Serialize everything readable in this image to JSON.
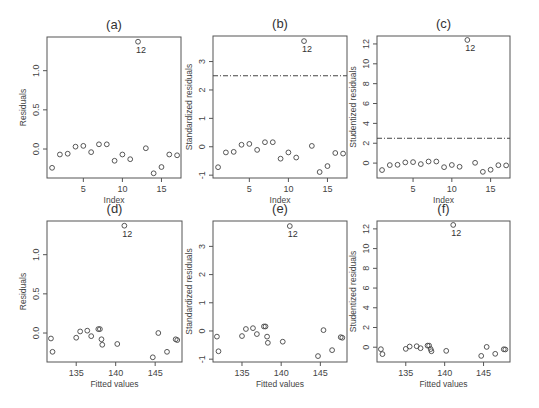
{
  "chart_data": [
    {
      "id": "a",
      "type": "scatter",
      "title": "(a)",
      "xlabel": "Index",
      "ylabel": "Residuals",
      "box": [
        47,
        37,
        181,
        178
      ],
      "xlim": [
        0.35,
        17.5
      ],
      "ylim": [
        -0.37,
        1.43
      ],
      "xticks": [
        5,
        10,
        15
      ],
      "yticks": [
        0.0,
        0.5,
        1.0
      ],
      "ytick_labels": [
        "0.0",
        "0.5",
        "1.0"
      ],
      "x": [
        1,
        2,
        3,
        4,
        5,
        6,
        7,
        8,
        9,
        10,
        11,
        12,
        13,
        14,
        15,
        16,
        17
      ],
      "y": [
        -0.24,
        -0.07,
        -0.06,
        0.03,
        0.04,
        -0.04,
        0.06,
        0.06,
        -0.15,
        -0.07,
        -0.13,
        1.37,
        0.01,
        -0.31,
        -0.23,
        -0.07,
        -0.08
      ],
      "annotations": [
        {
          "label": "12",
          "x": 12,
          "y": 1.37
        }
      ],
      "ref_line": null
    },
    {
      "id": "b",
      "type": "scatter",
      "title": "(b)",
      "xlabel": "Index",
      "ylabel": "Standardized residuals",
      "box": [
        213,
        36,
        347,
        178
      ],
      "xlim": [
        0.35,
        17.5
      ],
      "ylim": [
        -1.1,
        3.9
      ],
      "xticks": [
        5,
        10,
        15
      ],
      "yticks": [
        -1,
        0,
        1,
        2,
        3
      ],
      "ytick_labels": [
        "-1",
        "0",
        "1",
        "2",
        "3"
      ],
      "x": [
        1,
        2,
        3,
        4,
        5,
        6,
        7,
        8,
        9,
        10,
        11,
        12,
        13,
        14,
        15,
        16,
        17
      ],
      "y": [
        -0.72,
        -0.2,
        -0.18,
        0.07,
        0.1,
        -0.11,
        0.16,
        0.16,
        -0.42,
        -0.2,
        -0.38,
        3.72,
        0.03,
        -0.89,
        -0.68,
        -0.22,
        -0.24
      ],
      "annotations": [
        {
          "label": "12",
          "x": 12,
          "y": 3.72
        }
      ],
      "ref_line": 2.5
    },
    {
      "id": "c",
      "type": "scatter",
      "title": "(c)",
      "xlabel": "Index",
      "ylabel": "Studentized residuals",
      "box": [
        377,
        36,
        510,
        178
      ],
      "xlim": [
        0.35,
        17.5
      ],
      "ylim": [
        -1.5,
        12.8
      ],
      "xticks": [
        5,
        10,
        15
      ],
      "yticks": [
        0,
        2,
        4,
        6,
        8,
        10,
        12
      ],
      "ytick_labels": [
        "0",
        "2",
        "4",
        "6",
        "8",
        "10",
        "12"
      ],
      "x": [
        1,
        2,
        3,
        4,
        5,
        6,
        7,
        8,
        9,
        10,
        11,
        12,
        13,
        14,
        15,
        16,
        17
      ],
      "y": [
        -0.7,
        -0.2,
        -0.17,
        0.07,
        0.1,
        -0.1,
        0.16,
        0.16,
        -0.41,
        -0.19,
        -0.37,
        12.4,
        0.03,
        -0.88,
        -0.67,
        -0.21,
        -0.23
      ],
      "annotations": [
        {
          "label": "12",
          "x": 12,
          "y": 12.4
        }
      ],
      "ref_line": 2.5
    },
    {
      "id": "d",
      "type": "scatter",
      "title": "(d)",
      "xlabel": "Fitted values",
      "ylabel": "Residuals",
      "box": [
        47,
        221,
        182,
        362
      ],
      "xlim": [
        131.3,
        148.4
      ],
      "ylim": [
        -0.37,
        1.43
      ],
      "xticks": [
        135,
        140,
        145
      ],
      "yticks": [
        0.0,
        0.5,
        1.0
      ],
      "ytick_labels": [
        "0.0",
        "0.5",
        "1.0"
      ],
      "x": [
        131.8,
        132.0,
        135.0,
        135.5,
        136.4,
        136.9,
        137.8,
        138.0,
        138.2,
        138.3,
        140.2,
        141.1,
        145.4,
        144.7,
        146.5,
        147.6,
        147.8
      ],
      "y": [
        -0.07,
        -0.24,
        -0.06,
        0.02,
        0.03,
        -0.04,
        0.05,
        0.05,
        -0.08,
        -0.15,
        -0.14,
        1.37,
        0.0,
        -0.31,
        -0.24,
        -0.08,
        -0.09
      ],
      "annotations": [
        {
          "label": "12",
          "x": 141.1,
          "y": 1.37
        }
      ],
      "ref_line": null
    },
    {
      "id": "e",
      "type": "scatter",
      "title": "(e)",
      "xlabel": "Fitted values",
      "ylabel": "Standardized residuals",
      "box": [
        213,
        221,
        347,
        362
      ],
      "xlim": [
        131.3,
        148.4
      ],
      "ylim": [
        -1.1,
        3.9
      ],
      "xticks": [
        135,
        140,
        145
      ],
      "yticks": [
        -1,
        0,
        1,
        2,
        3
      ],
      "ytick_labels": [
        "-1",
        "0",
        "1",
        "2",
        "3"
      ],
      "x": [
        131.8,
        132.0,
        135.0,
        135.5,
        136.4,
        136.9,
        137.8,
        138.0,
        138.2,
        138.3,
        140.2,
        141.1,
        145.4,
        144.7,
        146.5,
        147.6,
        147.8
      ],
      "y": [
        -0.2,
        -0.72,
        -0.18,
        0.07,
        0.1,
        -0.11,
        0.16,
        0.16,
        -0.2,
        -0.42,
        -0.38,
        3.72,
        0.03,
        -0.89,
        -0.68,
        -0.22,
        -0.24
      ],
      "annotations": [
        {
          "label": "12",
          "x": 141.1,
          "y": 3.72
        }
      ],
      "ref_line": null
    },
    {
      "id": "f",
      "type": "scatter",
      "title": "(f)",
      "xlabel": "Fitted values",
      "ylabel": "Studentized residuals",
      "box": [
        377,
        221,
        510,
        362
      ],
      "xlim": [
        131.3,
        148.4
      ],
      "ylim": [
        -1.5,
        12.8
      ],
      "xticks": [
        135,
        140,
        145
      ],
      "yticks": [
        0,
        2,
        4,
        6,
        8,
        10,
        12
      ],
      "ytick_labels": [
        "0",
        "2",
        "4",
        "6",
        "8",
        "10",
        "12"
      ],
      "x": [
        131.8,
        132.0,
        135.0,
        135.5,
        136.4,
        136.9,
        137.8,
        138.0,
        138.2,
        138.3,
        140.2,
        141.1,
        145.4,
        144.7,
        146.5,
        147.6,
        147.8
      ],
      "y": [
        -0.2,
        -0.7,
        -0.17,
        0.07,
        0.1,
        -0.1,
        0.16,
        0.16,
        -0.19,
        -0.41,
        -0.37,
        12.4,
        0.03,
        -0.88,
        -0.67,
        -0.21,
        -0.23
      ],
      "annotations": [
        {
          "label": "12",
          "x": 141.1,
          "y": 12.4
        }
      ],
      "ref_line": null
    }
  ]
}
